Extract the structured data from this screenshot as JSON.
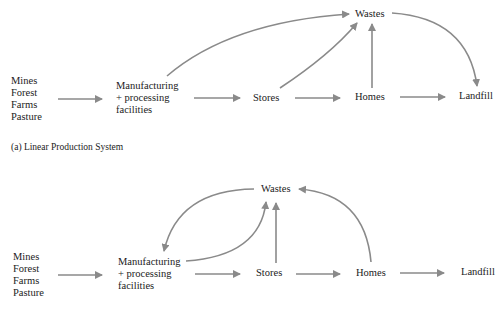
{
  "diagram_a": {
    "caption": "(a) Linear Production System",
    "sources": [
      "Mines",
      "Forest",
      "Farms",
      "Pasture"
    ],
    "manufacturing": [
      "Manufacturing",
      "+ processing",
      "facilities"
    ],
    "stores": "Stores",
    "homes": "Homes",
    "landfill": "Landfill",
    "wastes": "Wastes"
  },
  "diagram_b": {
    "sources": [
      "Mines",
      "Forest",
      "Farms",
      "Pasture"
    ],
    "manufacturing": [
      "Manufacturing",
      "+ processing",
      "facilities"
    ],
    "stores": "Stores",
    "homes": "Homes",
    "landfill": "Landfill",
    "wastes": "Wastes"
  },
  "colors": {
    "arrow": "#8a8a8a",
    "text": "#222222"
  }
}
